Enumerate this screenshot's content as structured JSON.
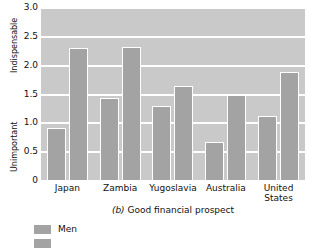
{
  "chart_data": {
    "type": "bar",
    "title": "(b) Good financial prospect",
    "title_prefix": "(b)",
    "title_rest": " Good financial prospect",
    "xlabel": "",
    "ylabel": "",
    "ylabel_top": "Indispensable",
    "ylabel_bottom": "Unimportant",
    "ylim": [
      0,
      3.0
    ],
    "ytick_labels": [
      "0",
      "0.5",
      "1.0",
      "1.5",
      "2.0",
      "2.5",
      "3.0"
    ],
    "ytick_values": [
      0,
      0.5,
      1.0,
      1.5,
      2.0,
      2.5,
      3.0
    ],
    "grid": true,
    "grid_color": "#ffffff",
    "plot_background": "#c9c9c9",
    "bar_color": "#a3a3a3",
    "legend_position": "below-left",
    "categories": [
      "Japan",
      "Zambia",
      "Yugoslavia",
      "Australia",
      "United States"
    ],
    "series": [
      {
        "name": "Men",
        "color": "#a3a3a3",
        "values": [
          0.9,
          1.42,
          1.28,
          0.66,
          1.11
        ]
      },
      {
        "name": "Women",
        "color": "#a3a3a3",
        "values": [
          2.29,
          2.31,
          1.63,
          1.47,
          1.88
        ]
      }
    ],
    "legend": [
      {
        "label": "Men",
        "color": "#a3a3a3"
      },
      {
        "label": "",
        "color": "#a3a3a3"
      }
    ]
  }
}
